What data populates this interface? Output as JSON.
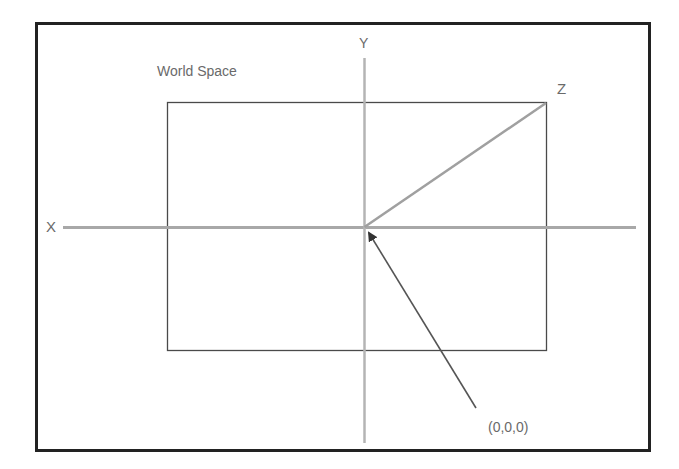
{
  "title": "World Space",
  "axes": {
    "x_label": "X",
    "y_label": "Y",
    "z_label": "Z"
  },
  "origin_label": "(0,0,0)",
  "colors": {
    "frame": "#222222",
    "inner_rect": "#4a4a4a",
    "axis": "#a8a8a8",
    "z_line": "#a0a0a0",
    "arrow": "#555555",
    "text": "#6a6a6a"
  }
}
